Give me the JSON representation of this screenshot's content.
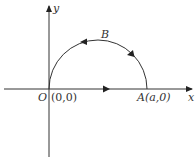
{
  "diagram": {
    "axes": {
      "x_label": "x",
      "y_label": "y"
    },
    "points": {
      "origin": {
        "name": "O",
        "coords": "(0,0)"
      },
      "A": {
        "name": "A",
        "coords": "(a,0)"
      },
      "B": {
        "name": "B"
      }
    },
    "path": "semicircle from A to O through B, then straight segment O to A, counterclockwise"
  }
}
